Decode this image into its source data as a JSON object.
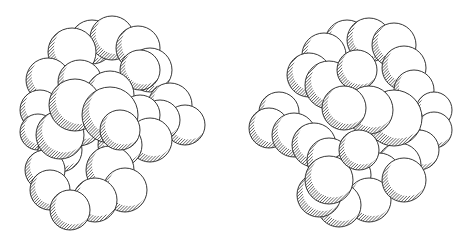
{
  "figure": {
    "type": "stereo-pair",
    "panels": [
      {
        "name": "left-view",
        "label": ""
      },
      {
        "name": "right-view",
        "label": ""
      }
    ],
    "colors": {
      "background": "#ffffff",
      "sphere_fill": "#ffffff",
      "outline": "#222222",
      "hatch": "#333333"
    }
  }
}
